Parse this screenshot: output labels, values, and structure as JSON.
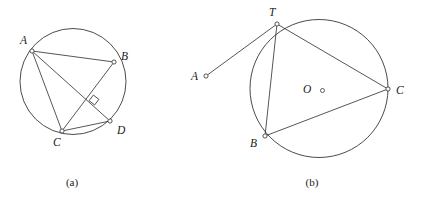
{
  "figure": {
    "type": "geometry-diagram",
    "width": 425,
    "height": 202,
    "background_color": "#ffffff",
    "ink_color": "#2b2b2b",
    "panels": [
      {
        "id": "panel-a",
        "caption": "(a)",
        "caption_pos": {
          "x": 72,
          "y": 186
        },
        "circle": {
          "cx": 73,
          "cy": 81.5,
          "r": 53
        },
        "points": [
          {
            "name": "A",
            "x": 32,
            "y": 51,
            "label": "A",
            "label_x": 20,
            "label_y": 44
          },
          {
            "name": "B",
            "x": 114,
            "y": 62,
            "label": "B",
            "label_x": 121,
            "label_y": 60
          },
          {
            "name": "C",
            "x": 62,
            "y": 131,
            "label": "C",
            "label_x": 53,
            "label_y": 146
          },
          {
            "name": "D",
            "x": 110,
            "y": 121,
            "label": "D",
            "label_x": 117,
            "label_y": 134
          }
        ],
        "segments": [
          {
            "name": "AB",
            "from": "A",
            "to": "B"
          },
          {
            "name": "AC",
            "from": "A",
            "to": "C"
          },
          {
            "name": "AD",
            "from": "A",
            "to": "D"
          },
          {
            "name": "BC",
            "from": "B",
            "to": "C"
          },
          {
            "name": "CD",
            "from": "C",
            "to": "D"
          }
        ],
        "right_angle": {
          "name": "right-angle-AD-BC",
          "x": 90.5,
          "y": 96.5,
          "size": 7,
          "rotation_deg": 38
        }
      },
      {
        "id": "panel-b",
        "caption": "(b)",
        "caption_pos": {
          "x": 312,
          "y": 186
        },
        "circle": {
          "cx": 319,
          "cy": 88.5,
          "r": 69
        },
        "center": {
          "name": "O",
          "x": 322.5,
          "y": 90.5,
          "label": "O",
          "label_x": 303,
          "label_y": 93
        },
        "points": [
          {
            "name": "T",
            "x": 277,
            "y": 24,
            "label": "T",
            "label_x": 269,
            "label_y": 16
          },
          {
            "name": "B",
            "x": 265,
            "y": 136,
            "label": "B",
            "label_x": 250,
            "label_y": 147
          },
          {
            "name": "C",
            "x": 388,
            "y": 89,
            "label": "C",
            "label_x": 396,
            "label_y": 94
          },
          {
            "name": "A",
            "x": 206,
            "y": 76,
            "label": "A",
            "label_x": 191,
            "label_y": 80
          }
        ],
        "segments": [
          {
            "name": "AT-tangent",
            "from": "A",
            "to": "T"
          },
          {
            "name": "TB",
            "from": "T",
            "to": "B"
          },
          {
            "name": "TC",
            "from": "T",
            "to": "C"
          },
          {
            "name": "BC",
            "from": "B",
            "to": "C"
          }
        ]
      }
    ]
  }
}
